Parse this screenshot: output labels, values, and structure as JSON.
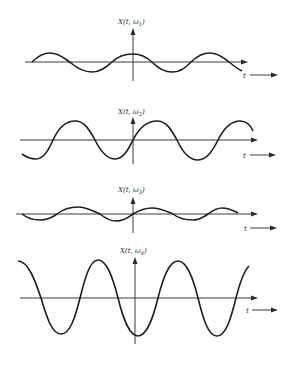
{
  "figure": {
    "panels": [
      {
        "id": "omega1",
        "y_label_prefix": "X(t, ω",
        "y_label_sub": "1",
        "y_label_suffix": ")",
        "x_label": "t",
        "amplitude": "small",
        "phase_at_origin": "crest"
      },
      {
        "id": "omega2",
        "y_label_prefix": "X(t, ω",
        "y_label_sub": "2",
        "y_label_suffix": ")",
        "x_label": "t",
        "amplitude": "medium",
        "phase_at_origin": "rising zero-crossing"
      },
      {
        "id": "omega3",
        "y_label_prefix": "X(t, ω",
        "y_label_sub": "3",
        "y_label_suffix": ")",
        "x_label": "t",
        "amplitude": "small",
        "phase_at_origin": "rising zero-crossing"
      },
      {
        "id": "omega4",
        "y_label_prefix": "X(t, ω",
        "y_label_sub": "4",
        "y_label_suffix": ")",
        "x_label": "t",
        "amplitude": "large",
        "phase_at_origin": "trough"
      }
    ]
  },
  "colors": {
    "ink": "#1e1e1e",
    "background": "#ffffff"
  }
}
